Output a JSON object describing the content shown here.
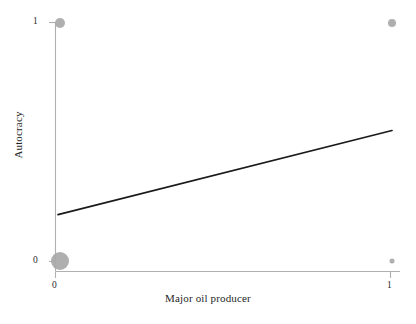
{
  "chart_data": {
    "type": "scatter",
    "title": "",
    "subtitle": "",
    "xlabel": "Major oil producer",
    "ylabel": "Autocracy",
    "xlim": [
      0,
      1
    ],
    "ylim": [
      0,
      1
    ],
    "xticks": [
      0,
      1
    ],
    "xtick_labels": [
      "0",
      "1"
    ],
    "yticks": [
      0,
      1
    ],
    "ytick_labels": [
      "0",
      "1"
    ],
    "grid": false,
    "legend": null,
    "annotations": [],
    "point_color": "#a8a8a8",
    "line_color": "#1a1a1a",
    "axis_color": "#b3b3b3",
    "series": [
      {
        "name": "observations",
        "marker": "circle",
        "color": "#a8a8a8",
        "points": [
          {
            "x": 0,
            "y": 0,
            "size": 9.0
          },
          {
            "x": 0,
            "y": 1,
            "size": 5.0
          },
          {
            "x": 1,
            "y": 1,
            "size": 4.0
          },
          {
            "x": 1,
            "y": 0,
            "size": 2.5
          }
        ]
      },
      {
        "name": "fitted-line",
        "marker": "line",
        "color": "#1a1a1a",
        "points": [
          {
            "x": 0,
            "y": 0.196
          },
          {
            "x": 1,
            "y": 0.548
          }
        ]
      }
    ]
  },
  "axis": {
    "x_title": "Major oil producer",
    "y_title": "Autocracy",
    "x_tick_0": "0",
    "x_tick_1": "1",
    "y_tick_0": "0",
    "y_tick_1": "1"
  }
}
